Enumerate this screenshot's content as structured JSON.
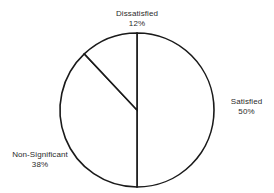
{
  "chart_data": {
    "type": "pie",
    "title": "",
    "subtitle": "",
    "xlabel": "",
    "ylabel": "",
    "grid": false,
    "legend_position": "none",
    "labels_outside": true,
    "total": 100,
    "units": "%",
    "start_angle_deg": 0,
    "direction": "clockwise",
    "categories": [
      "Satisfied",
      "Non-Significant",
      "Dissatisfied"
    ],
    "values": [
      50,
      38,
      12
    ],
    "slices": [
      {
        "name": "Satisfied",
        "value": 50,
        "value_label": "50%",
        "start_angle_deg": 0,
        "end_angle_deg": 180,
        "sweep_deg": 180,
        "fill": "#ffffff",
        "stroke": "#1a1a1a",
        "label_position": "right"
      },
      {
        "name": "Non-Significant",
        "value": 38,
        "value_label": "38%",
        "start_angle_deg": 180,
        "end_angle_deg": 316.8,
        "sweep_deg": 136.8,
        "fill": "#ffffff",
        "stroke": "#1a1a1a",
        "label_position": "bottom-left"
      },
      {
        "name": "Dissatisfied",
        "value": 12,
        "value_label": "12%",
        "start_angle_deg": 316.8,
        "end_angle_deg": 360,
        "sweep_deg": 43.2,
        "fill": "#ffffff",
        "stroke": "#1a1a1a",
        "label_position": "top"
      }
    ],
    "geometry": {
      "center_x": 137,
      "center_y": 110,
      "radius": 77
    },
    "style": {
      "background": "#ffffff",
      "outline_color": "#1a1a1a",
      "text_color": "#2b2b2b"
    }
  },
  "labels": {
    "dissatisfied": {
      "name": "Dissatisfied",
      "value": "12%"
    },
    "satisfied": {
      "name": "Satisfied",
      "value": "50%"
    },
    "non_significant": {
      "name": "Non-Significant",
      "value": "38%"
    }
  }
}
